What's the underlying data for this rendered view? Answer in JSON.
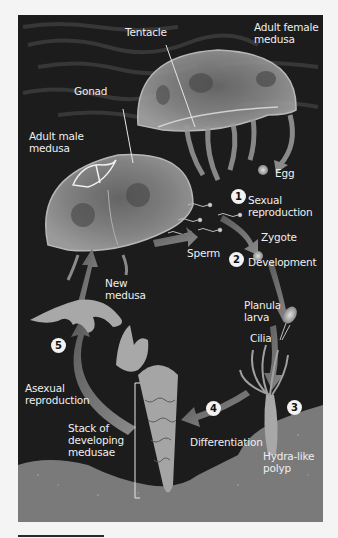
{
  "figure": {
    "colors": {
      "background": "#1c1c1c",
      "seabed": "#7a7a7a",
      "label_text": "#eeeeee",
      "step_marker": "#f2f2f2"
    }
  },
  "labels": {
    "tentacle": "Tentacle",
    "adult_female": [
      "Adult female",
      "medusa"
    ],
    "gonad": "Gonad",
    "adult_male": [
      "Adult male",
      "medusa"
    ],
    "egg": "Egg",
    "sexual_reproduction": [
      "Sexual",
      "reproduction"
    ],
    "zygote": "Zygote",
    "sperm": "Sperm",
    "development": "Development",
    "new_medusa": [
      "New",
      "medusa"
    ],
    "planula_larva": [
      "Planula",
      "larva"
    ],
    "cilia": "Cilia",
    "asexual_reproduction": [
      "Asexual",
      "reproduction"
    ],
    "stack": [
      "Stack of",
      "developing",
      "medusae"
    ],
    "differentiation": "Differentiation",
    "hydra_polyp": [
      "Hydra-like",
      "polyp"
    ]
  },
  "steps": [
    "1",
    "2",
    "3",
    "4",
    "5"
  ]
}
